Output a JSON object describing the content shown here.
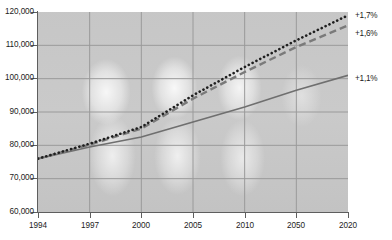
{
  "chart_data": {
    "type": "line",
    "title": "",
    "subtitle": "",
    "xlabel": "",
    "ylabel": "",
    "x": [
      "1994",
      "1997",
      "2000",
      "2005",
      "2010",
      "2050",
      "2020"
    ],
    "tick_labels_x": [
      "1994",
      "1997",
      "2000",
      "2005",
      "2010",
      "2050",
      "2020"
    ],
    "tick_labels_y": [
      "60,000",
      "70,000",
      "80,000",
      "90,000",
      "100,000",
      "110,000",
      "120,000"
    ],
    "ylim": [
      60000,
      120000
    ],
    "ytick_step": 10000,
    "grid": true,
    "legend_position": "right-end-labels",
    "series": [
      {
        "name": "+1,7%",
        "style": "dotted",
        "color": "#1f1f1f",
        "end_label": "+1,7%",
        "values": [
          76000,
          80500,
          85500,
          95000,
          103500,
          111500,
          119000
        ]
      },
      {
        "name": "+1,6%",
        "style": "dashed",
        "color": "#6f6f6f",
        "end_label": "+1,6%",
        "values": [
          76000,
          80200,
          85000,
          94000,
          102000,
          109500,
          116000
        ]
      },
      {
        "name": "+1,1%",
        "style": "solid",
        "color": "#6f6f6f",
        "end_label": "+1,1%",
        "values": [
          76000,
          79500,
          82500,
          87000,
          91500,
          96500,
          101000
        ]
      }
    ]
  },
  "axes": {
    "y_labels": [
      "120,000",
      "110,000",
      "100,000",
      "90,000",
      "80,000",
      "70,000",
      "60,000"
    ],
    "x_labels": [
      "1994",
      "1997",
      "2000",
      "2005",
      "2010",
      "2050",
      "2020"
    ]
  },
  "end_labels": [
    {
      "text": "+1,7%"
    },
    {
      "text": "+1,6%"
    },
    {
      "text": "+1,1%"
    }
  ],
  "colors": {
    "plot_background": "#c9c9c9",
    "gridline": "#9a9a9a",
    "axis": "#5e5e5e",
    "series_dotted": "#1f1f1f",
    "series_dashed": "#6f6f6f",
    "series_solid": "#6f6f6f",
    "text": "#1c1c1c"
  }
}
